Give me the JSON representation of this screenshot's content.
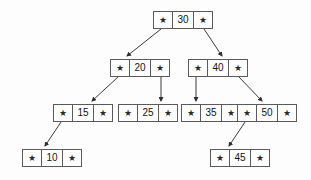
{
  "diagram": {
    "type": "binary-search-tree",
    "pointer_glyph": "★",
    "colors": {
      "background": "#fdfdfd",
      "node_border": "#5a5a5a",
      "node_fill": "#ffffff",
      "edge": "#3a3a3a",
      "text": "#111111"
    },
    "nodes": [
      {
        "id": "n30",
        "value": "30",
        "left_ptr": "★",
        "right_ptr": "★",
        "level": 0,
        "x": 153,
        "y": 11
      },
      {
        "id": "n20",
        "value": "20",
        "left_ptr": "★",
        "right_ptr": "★",
        "level": 1,
        "x": 110,
        "y": 59
      },
      {
        "id": "n40",
        "value": "40",
        "left_ptr": "★",
        "right_ptr": "★",
        "level": 1,
        "x": 188,
        "y": 59
      },
      {
        "id": "n15",
        "value": "15",
        "left_ptr": "★",
        "right_ptr": "★",
        "level": 2,
        "x": 53,
        "y": 104
      },
      {
        "id": "n25",
        "value": "25",
        "left_ptr": "★",
        "right_ptr": "★",
        "level": 2,
        "x": 118,
        "y": 104
      },
      {
        "id": "n35",
        "value": "35",
        "left_ptr": "★",
        "right_ptr": "★",
        "level": 2,
        "x": 181,
        "y": 104
      },
      {
        "id": "n50",
        "value": "50",
        "left_ptr": "★",
        "right_ptr": "★",
        "level": 2,
        "x": 237,
        "y": 104
      },
      {
        "id": "n10",
        "value": "10",
        "left_ptr": "★",
        "right_ptr": "★",
        "level": 3,
        "x": 22,
        "y": 149
      },
      {
        "id": "n45",
        "value": "45",
        "left_ptr": "★",
        "right_ptr": "★",
        "level": 3,
        "x": 210,
        "y": 149
      }
    ],
    "edges": [
      {
        "id": "e30-20",
        "from": "n30",
        "from_side": "left",
        "to": "n20",
        "x1": 161,
        "y1": 29,
        "x2": 127,
        "y2": 56
      },
      {
        "id": "e30-40",
        "from": "n30",
        "from_side": "right",
        "to": "n40",
        "x1": 204,
        "y1": 29,
        "x2": 222,
        "y2": 56
      },
      {
        "id": "e20-15",
        "from": "n20",
        "from_side": "left",
        "to": "n15",
        "x1": 118,
        "y1": 77,
        "x2": 92,
        "y2": 101
      },
      {
        "id": "e20-25",
        "from": "n20",
        "from_side": "right",
        "to": "n25",
        "x1": 161,
        "y1": 77,
        "x2": 161,
        "y2": 101
      },
      {
        "id": "e40-35",
        "from": "n40",
        "from_side": "left",
        "to": "n35",
        "x1": 196,
        "y1": 77,
        "x2": 196,
        "y2": 101
      },
      {
        "id": "e40-50",
        "from": "n40",
        "from_side": "right",
        "to": "n50",
        "x1": 239,
        "y1": 77,
        "x2": 262,
        "y2": 101
      },
      {
        "id": "e15-10",
        "from": "n15",
        "from_side": "left",
        "to": "n10",
        "x1": 61,
        "y1": 122,
        "x2": 45,
        "y2": 146
      },
      {
        "id": "e50-45",
        "from": "n50",
        "from_side": "left",
        "to": "n45",
        "x1": 245,
        "y1": 122,
        "x2": 229,
        "y2": 146
      }
    ]
  }
}
